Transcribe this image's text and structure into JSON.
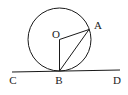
{
  "figure": {
    "type": "geometry-diagram",
    "background_color": "#ffffff",
    "stroke_color": "#1a1a1a",
    "label_color": "#1a1a1a",
    "canvas": {
      "width": 128,
      "height": 95
    }
  },
  "labels": {
    "center": "O",
    "point_a": "A",
    "point_b": "B",
    "line_left": "C",
    "line_right": "D"
  },
  "label_positions": {
    "center": {
      "x": 56,
      "y": 38
    },
    "point_a": {
      "x": 98,
      "y": 29
    },
    "point_b": {
      "x": 59,
      "y": 84
    },
    "line_left": {
      "x": 13,
      "y": 84
    },
    "line_right": {
      "x": 117,
      "y": 84
    }
  },
  "geometry": {
    "circle": {
      "cx": 59.5,
      "cy": 39.5,
      "r": 31.5
    },
    "points": {
      "O": {
        "x": 59.5,
        "y": 39.5
      },
      "A": {
        "x": 89.0,
        "y": 29.5
      },
      "B": {
        "x": 59.5,
        "y": 71.0
      },
      "C": {
        "x": 12.0,
        "y": 72.0
      },
      "D": {
        "x": 120.0,
        "y": 70.0
      }
    },
    "segments": [
      {
        "name": "radius-OA",
        "from": "O",
        "to": "A"
      },
      {
        "name": "radius-OB",
        "from": "O",
        "to": "B"
      },
      {
        "name": "chord-BA",
        "from": "B",
        "to": "A"
      },
      {
        "name": "tangent-CD",
        "from": "C",
        "to": "D"
      }
    ],
    "stroke_width": 1
  }
}
